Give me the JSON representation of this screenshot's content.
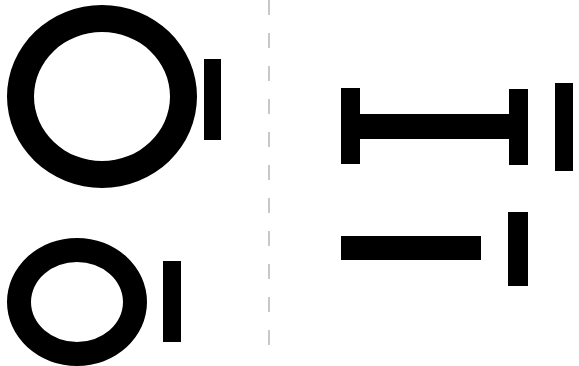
{
  "colors": {
    "glyph": "#000000",
    "background": "#ffffff",
    "divider": "#c8c8c8"
  },
  "left_panel": {
    "glyphs": [
      {
        "id": "large-o",
        "label": "O"
      },
      {
        "id": "large-i",
        "label": "I"
      },
      {
        "id": "small-o",
        "label": "O"
      },
      {
        "id": "small-i",
        "label": "I"
      }
    ]
  },
  "right_panel": {
    "glyphs": [
      {
        "id": "i-beam",
        "label": "I-beam (rotated H)"
      },
      {
        "id": "tall-i",
        "label": "I"
      },
      {
        "id": "horizontal-bar",
        "label": "–"
      },
      {
        "id": "lower-i",
        "label": "I"
      }
    ]
  }
}
